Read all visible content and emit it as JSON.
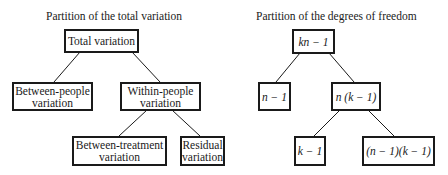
{
  "left_diagram": {
    "title": "Partition of the total variation",
    "nodes": {
      "root": {
        "line1": "Total variation",
        "line2": ""
      },
      "between_people": {
        "line1": "Between-people",
        "line2": "variation"
      },
      "within_people": {
        "line1": "Within-people",
        "line2": "variation"
      },
      "between_treatment": {
        "line1": "Between-treatment",
        "line2": "variation"
      },
      "residual": {
        "line1": "Residual",
        "line2": "variation"
      }
    }
  },
  "right_diagram": {
    "title": "Partition of the degrees of freedom",
    "nodes": {
      "root": "kn − 1",
      "n_minus_1": "n − 1",
      "n_k_minus_1": "n (k − 1)",
      "k_minus_1": "k − 1",
      "residual_df": "(n − 1)(k − 1)"
    }
  }
}
